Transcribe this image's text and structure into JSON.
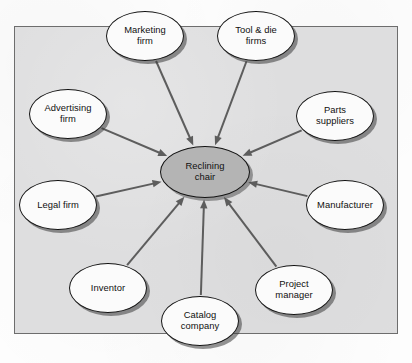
{
  "diagram": {
    "frame": {
      "fill": "#dededf",
      "border": "#6d6d6d"
    },
    "center": {
      "id": "reclining-chair",
      "label": "Reclining chair",
      "lines": [
        "Reclining",
        "chair"
      ],
      "x": 205,
      "y": 172,
      "rx": 45,
      "ry": 26,
      "fill": "#b4b4b4"
    },
    "nodes": [
      {
        "id": "marketing-firm",
        "label": "Marketing firm",
        "lines": [
          "Marketing",
          "firm"
        ],
        "x": 145,
        "y": 36,
        "rx": 39,
        "ry": 25,
        "fill": "#fbfbfb"
      },
      {
        "id": "tool-and-die-firms",
        "label": "Tool & die firms",
        "lines": [
          "Tool & die",
          "firms"
        ],
        "x": 256,
        "y": 36,
        "rx": 39,
        "ry": 25,
        "fill": "#fbfbfb"
      },
      {
        "id": "advertising-firm",
        "label": "Advertising firm",
        "lines": [
          "Advertising",
          "firm"
        ],
        "x": 68,
        "y": 114,
        "rx": 39,
        "ry": 25,
        "fill": "#fbfbfb"
      },
      {
        "id": "parts-suppliers",
        "label": "Parts suppliers",
        "lines": [
          "Parts",
          "suppliers"
        ],
        "x": 335,
        "y": 116,
        "rx": 39,
        "ry": 25,
        "fill": "#fbfbfb"
      },
      {
        "id": "legal-firm",
        "label": "Legal firm",
        "lines": [
          "Legal firm"
        ],
        "x": 58,
        "y": 205,
        "rx": 39,
        "ry": 25,
        "fill": "#fbfbfb"
      },
      {
        "id": "manufacturer",
        "label": "Manufacturer",
        "lines": [
          "Manufacturer"
        ],
        "x": 345,
        "y": 205,
        "rx": 39,
        "ry": 25,
        "fill": "#fbfbfb"
      },
      {
        "id": "inventor",
        "label": "Inventor",
        "lines": [
          "Inventor"
        ],
        "x": 108,
        "y": 288,
        "rx": 39,
        "ry": 25,
        "fill": "#fbfbfb"
      },
      {
        "id": "project-manager",
        "label": "Project manager",
        "lines": [
          "Project",
          "manager"
        ],
        "x": 294,
        "y": 290,
        "rx": 39,
        "ry": 25,
        "fill": "#fbfbfb"
      },
      {
        "id": "catalog-company",
        "label": "Catalog company",
        "lines": [
          "Catalog",
          "company"
        ],
        "x": 200,
        "y": 321,
        "rx": 39,
        "ry": 25,
        "fill": "#fbfbfb"
      }
    ],
    "edges": [
      {
        "id": "edge-marketing-firm",
        "from": "marketing-firm",
        "to": "reclining-chair",
        "arrow": "to"
      },
      {
        "id": "edge-tool-and-die-firms",
        "from": "tool-and-die-firms",
        "to": "reclining-chair",
        "arrow": "to"
      },
      {
        "id": "edge-advertising-firm",
        "from": "advertising-firm",
        "to": "reclining-chair",
        "arrow": "to"
      },
      {
        "id": "edge-parts-suppliers",
        "from": "parts-suppliers",
        "to": "reclining-chair",
        "arrow": "to"
      },
      {
        "id": "edge-legal-firm",
        "from": "legal-firm",
        "to": "reclining-chair",
        "arrow": "to"
      },
      {
        "id": "edge-manufacturer",
        "from": "manufacturer",
        "to": "reclining-chair",
        "arrow": "to"
      },
      {
        "id": "edge-inventor",
        "from": "inventor",
        "to": "reclining-chair",
        "arrow": "to"
      },
      {
        "id": "edge-project-manager",
        "from": "project-manager",
        "to": "reclining-chair",
        "arrow": "to"
      },
      {
        "id": "edge-catalog-company",
        "from": "catalog-company",
        "to": "reclining-chair",
        "arrow": "to"
      }
    ],
    "edge_color": "#5d5d5d"
  }
}
